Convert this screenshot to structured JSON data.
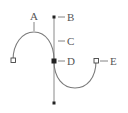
{
  "diagram": {
    "type": "bezier-path-anatomy",
    "labels": {
      "A": "A",
      "B": "B",
      "C": "C",
      "D": "D",
      "E": "E"
    },
    "colors": {
      "curve": "#7a7a7a",
      "handle_line": "#8a8a8a",
      "point": "#222222",
      "text": "#555555",
      "background": "#ffffff"
    },
    "elements": [
      {
        "id": "A",
        "meaning": "segment (curve)"
      },
      {
        "id": "B",
        "meaning": "direction point"
      },
      {
        "id": "C",
        "meaning": "direction line"
      },
      {
        "id": "D",
        "meaning": "selected anchor point"
      },
      {
        "id": "E",
        "meaning": "unselected anchor point"
      }
    ]
  }
}
